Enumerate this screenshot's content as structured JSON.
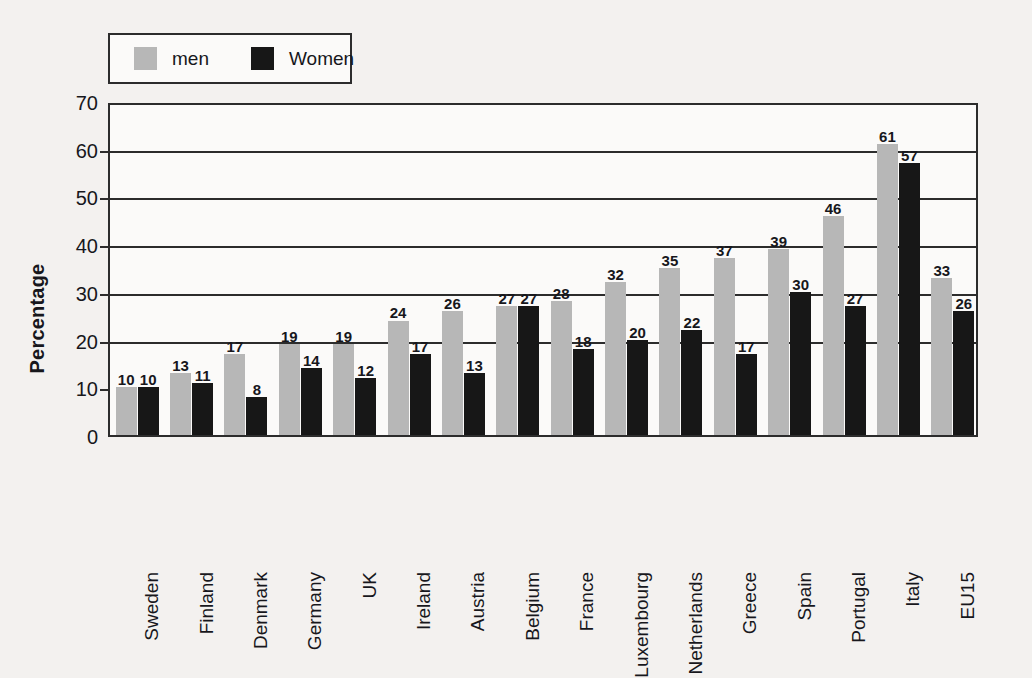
{
  "chart_data": {
    "type": "bar",
    "title": "",
    "xlabel": "",
    "ylabel": "Percentage",
    "ylim": [
      0,
      70
    ],
    "ytick_step": 10,
    "yticks": [
      0,
      10,
      20,
      30,
      40,
      50,
      60,
      70
    ],
    "gridlines_at": [
      20,
      30,
      40,
      50,
      60
    ],
    "grid": true,
    "legend_position": "top-left",
    "categories": [
      "Sweden",
      "Finland",
      "Denmark",
      "Germany",
      "UK",
      "Ireland",
      "Austria",
      "Belgium",
      "France",
      "Luxembourg",
      "Netherlands",
      "Greece",
      "Spain",
      "Portugal",
      "Italy",
      "EU15"
    ],
    "series": [
      {
        "name": "men",
        "color": "#b7b7b7",
        "values": [
          10,
          13,
          17,
          19,
          19,
          24,
          26,
          27,
          28,
          32,
          35,
          37,
          39,
          46,
          61,
          33
        ]
      },
      {
        "name": "Women",
        "color": "#171717",
        "values": [
          10,
          11,
          8,
          14,
          12,
          17,
          13,
          27,
          18,
          20,
          22,
          17,
          30,
          27,
          57,
          26
        ]
      }
    ]
  },
  "legend": {
    "items": [
      {
        "label": "men",
        "color": "#b7b7b7"
      },
      {
        "label": "Women",
        "color": "#171717"
      }
    ]
  },
  "axes": {
    "y_title": "Percentage",
    "y_ticks": [
      "0",
      "10",
      "20",
      "30",
      "40",
      "50",
      "60",
      "70"
    ]
  },
  "colors": {
    "background": "#f3f1ef",
    "plot_background": "#fbfaf9",
    "axis": "#2c2c2c",
    "text": "#17171c",
    "men": "#b7b7b7",
    "women": "#171717"
  }
}
